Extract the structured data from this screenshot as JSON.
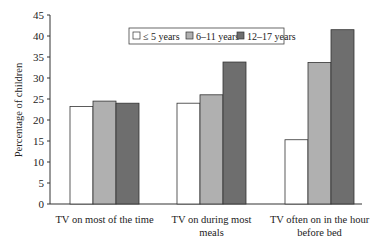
{
  "chart_data": {
    "type": "bar",
    "title": "",
    "xlabel": "",
    "ylabel": "Percentage of children",
    "ylim": [
      0,
      45
    ],
    "yticks": [
      0,
      5,
      10,
      15,
      20,
      25,
      30,
      35,
      40,
      45
    ],
    "grid": false,
    "legend_position": "top-right inside",
    "categories": [
      [
        "TV on most of the time"
      ],
      [
        "TV on during most",
        "meals"
      ],
      [
        "TV often on in the hour",
        "before bed"
      ]
    ],
    "category_labels": [
      "TV on most of the time",
      "TV on during most meals",
      "TV often on in the hour before bed"
    ],
    "series": [
      {
        "name": "≤ 5 years",
        "color": "#ffffff",
        "values": [
          23.2,
          24.0,
          15.3
        ]
      },
      {
        "name": "6–11 years",
        "color": "#b0b0b0",
        "values": [
          24.5,
          26.0,
          33.7
        ]
      },
      {
        "name": "12–17 years",
        "color": "#6e6e6e",
        "values": [
          24.0,
          33.8,
          41.5
        ]
      }
    ]
  }
}
